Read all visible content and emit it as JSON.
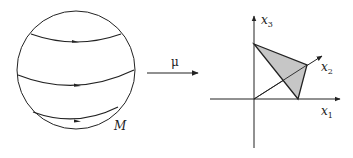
{
  "diagram": {
    "left": {
      "shape": "sphere",
      "label": "M",
      "orbit_count": 3
    },
    "map": {
      "label": "μ",
      "direction": "right"
    },
    "right": {
      "axes": {
        "x1": "x",
        "x1_sub": "1",
        "x2": "x",
        "x2_sub": "2",
        "x3": "x",
        "x3_sub": "3"
      },
      "polytope": "shaded triangle (simplex) with vertices on x1, x2, x3 axes",
      "fill_color": "#c8c8c8",
      "stroke_color": "#222222"
    }
  }
}
